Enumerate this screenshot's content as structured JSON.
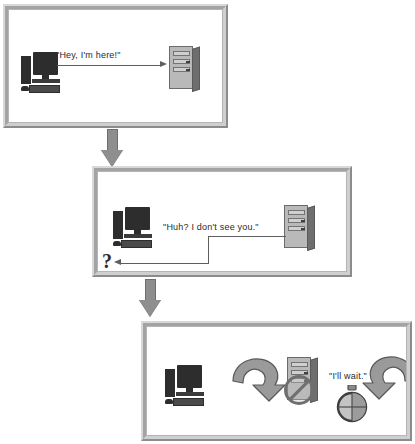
{
  "diagram": {
    "panels": [
      {
        "id": "panel-1",
        "name": "step-1-client-announces",
        "message": "\"Hey, I'm here!\"",
        "actors": [
          "desktop-computer",
          "server-tower"
        ],
        "direction": "client-to-server"
      },
      {
        "id": "panel-2",
        "name": "step-2-server-cannot-see-client",
        "message": "\"Huh? I don't see you.\"",
        "symbol": "?",
        "actors": [
          "desktop-computer",
          "server-tower"
        ],
        "direction": "server-to-client"
      },
      {
        "id": "panel-3",
        "name": "step-3-client-waits-retrying",
        "message": "\"I'll wait.\"",
        "actors": [
          "desktop-computer",
          "blocked-server-tower",
          "stopwatch"
        ],
        "loops": [
          "retry-loop-left",
          "retry-loop-right"
        ]
      }
    ],
    "connectors": [
      {
        "name": "connector-1",
        "from": "panel-1",
        "to": "panel-2",
        "glyph": "down-arrow"
      },
      {
        "name": "connector-2",
        "from": "panel-2",
        "to": "panel-3",
        "glyph": "down-arrow"
      }
    ]
  },
  "colors": {
    "background": "#ffffff",
    "frame_light": "#d8d8d8",
    "frame_dark": "#8c8c8c",
    "frame_mid": "#a3a3a3",
    "line": "#5e5e5e",
    "arrow_gray": "#8e8e8e",
    "icon_dark": "#2d2d2d",
    "server_body": "#b9b9b9",
    "text": "#2a2a2a"
  }
}
